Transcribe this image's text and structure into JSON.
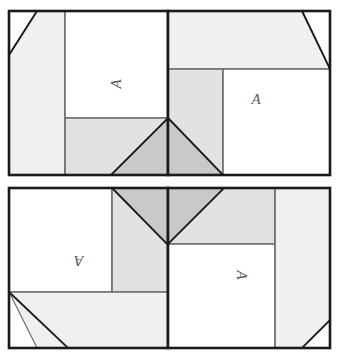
{
  "figure": {
    "background_color": "#ffffff",
    "outline_color": "#1a1a1a",
    "cut_line_color": "#1a1a1a",
    "divider_color": "#6b6b6b",
    "fill_white": "#ffffff",
    "fill_light_gray": "#f0f0f0",
    "fill_mid_gray": "#e2e2e2",
    "fill_dark_gray": "#c9c9c9",
    "letter_color": "#5a5a5a"
  },
  "panels": [
    {
      "id": "top-left",
      "label": "A",
      "label_rotation": "-90",
      "x": 9,
      "y": 11,
      "width": 159,
      "height": 164,
      "divider_vertical_x": 65,
      "divider_horizontal_y": 118,
      "letter_x": 116,
      "letter_y": 84
    },
    {
      "id": "top-right",
      "label": "A",
      "label_rotation": "0",
      "x": 168,
      "y": 11,
      "width": 162,
      "height": 164,
      "divider_vertical_x": 223,
      "divider_horizontal_y": 69,
      "letter_x": 256,
      "letter_y": 99
    },
    {
      "id": "bottom-left",
      "label": "A",
      "label_rotation": "180",
      "x": 9,
      "y": 188,
      "width": 159,
      "height": 160,
      "divider_vertical_x": 112,
      "divider_horizontal_y": 292,
      "letter_x": 79,
      "letter_y": 261
    },
    {
      "id": "bottom-right",
      "label": "A",
      "label_rotation": "90",
      "x": 168,
      "y": 188,
      "width": 162,
      "height": 160,
      "divider_vertical_x": 275,
      "divider_horizontal_y": 244,
      "letter_x": 242,
      "letter_y": 275
    }
  ]
}
